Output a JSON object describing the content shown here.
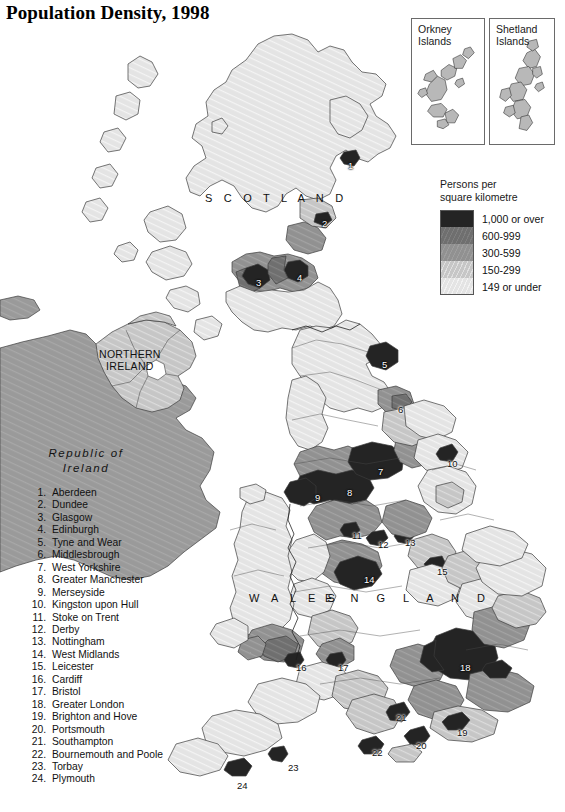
{
  "title": "Population Density, 1998",
  "insets": [
    {
      "name": "orkney",
      "label_line1": "Orkney",
      "label_line2": "Islands"
    },
    {
      "name": "shetland",
      "label_line1": "Shetland",
      "label_line2": "Islands"
    }
  ],
  "legend": {
    "title_line1": "Persons per",
    "title_line2": "square kilometre",
    "classes": [
      {
        "label": "1,000 or over",
        "color": "#242424"
      },
      {
        "label": "600-999",
        "color": "#6f6f6f"
      },
      {
        "label": "300-599",
        "color": "#919191"
      },
      {
        "label": "150-299",
        "color": "#c6c6c6"
      },
      {
        "label": "149 or under",
        "color": "#e4e4e4"
      }
    ]
  },
  "region_labels": {
    "scotland": "S C O T L A N D",
    "wales": "W A L E S",
    "england": "E N G L A N D",
    "northern_ireland_line1": "NORTHERN",
    "northern_ireland_line2": "IRELAND",
    "republic_of_ireland_line1": "Republic of",
    "republic_of_ireland_line2": "Ireland"
  },
  "city_key": [
    {
      "num": "1.",
      "name": "Aberdeen"
    },
    {
      "num": "2.",
      "name": "Dundee"
    },
    {
      "num": "3.",
      "name": "Glasgow"
    },
    {
      "num": "4.",
      "name": "Edinburgh"
    },
    {
      "num": "5.",
      "name": "Tyne and Wear"
    },
    {
      "num": "6.",
      "name": "Middlesbrough"
    },
    {
      "num": "7.",
      "name": "West Yorkshire"
    },
    {
      "num": "8.",
      "name": "Greater Manchester"
    },
    {
      "num": "9.",
      "name": "Merseyside"
    },
    {
      "num": "10.",
      "name": "Kingston upon Hull"
    },
    {
      "num": "11.",
      "name": "Stoke on Trent"
    },
    {
      "num": "12.",
      "name": "Derby"
    },
    {
      "num": "13.",
      "name": "Nottingham"
    },
    {
      "num": "14.",
      "name": "West Midlands"
    },
    {
      "num": "15.",
      "name": "Leicester"
    },
    {
      "num": "16.",
      "name": "Cardiff"
    },
    {
      "num": "17.",
      "name": "Bristol"
    },
    {
      "num": "18.",
      "name": "Greater London"
    },
    {
      "num": "19.",
      "name": "Brighton and Hove"
    },
    {
      "num": "20.",
      "name": "Portsmouth"
    },
    {
      "num": "21.",
      "name": "Southampton"
    },
    {
      "num": "22.",
      "name": "Bournemouth and Poole"
    },
    {
      "num": "23.",
      "name": "Torbay"
    },
    {
      "num": "24.",
      "name": "Plymouth"
    }
  ],
  "map_markers": [
    {
      "id": "1",
      "label": "1",
      "x": 348,
      "y": 160,
      "style": "light"
    },
    {
      "id": "2",
      "label": "2",
      "x": 322,
      "y": 218,
      "style": "light"
    },
    {
      "id": "3",
      "label": "3",
      "x": 256,
      "y": 277,
      "style": "light"
    },
    {
      "id": "4",
      "label": "4",
      "x": 297,
      "y": 272,
      "style": "light"
    },
    {
      "id": "5",
      "label": "5",
      "x": 382,
      "y": 359,
      "style": "light"
    },
    {
      "id": "6",
      "label": "6",
      "x": 398,
      "y": 404,
      "style": "dark"
    },
    {
      "id": "7",
      "label": "7",
      "x": 378,
      "y": 466,
      "style": "light"
    },
    {
      "id": "8",
      "label": "8",
      "x": 347,
      "y": 487,
      "style": "light"
    },
    {
      "id": "9",
      "label": "9",
      "x": 315,
      "y": 492,
      "style": "light"
    },
    {
      "id": "10",
      "label": "10",
      "x": 447,
      "y": 458,
      "style": "dark"
    },
    {
      "id": "11",
      "label": "11",
      "x": 352,
      "y": 530,
      "style": "dark"
    },
    {
      "id": "12",
      "label": "12",
      "x": 378,
      "y": 539,
      "style": "dark"
    },
    {
      "id": "13",
      "label": "13",
      "x": 405,
      "y": 537,
      "style": "dark"
    },
    {
      "id": "14",
      "label": "14",
      "x": 364,
      "y": 574,
      "style": "light"
    },
    {
      "id": "15",
      "label": "15",
      "x": 437,
      "y": 566,
      "style": "dark"
    },
    {
      "id": "16",
      "label": "16",
      "x": 296,
      "y": 662,
      "style": "dark"
    },
    {
      "id": "17",
      "label": "17",
      "x": 338,
      "y": 662,
      "style": "dark"
    },
    {
      "id": "18",
      "label": "18",
      "x": 460,
      "y": 662,
      "style": "light"
    },
    {
      "id": "19",
      "label": "19",
      "x": 457,
      "y": 727,
      "style": "dark"
    },
    {
      "id": "20",
      "label": "20",
      "x": 416,
      "y": 740,
      "style": "dark"
    },
    {
      "id": "21",
      "label": "21",
      "x": 396,
      "y": 712,
      "style": "dark"
    },
    {
      "id": "22",
      "label": "22",
      "x": 372,
      "y": 747,
      "style": "dark"
    },
    {
      "id": "23",
      "label": "23",
      "x": 288,
      "y": 762,
      "style": "dark"
    },
    {
      "id": "24",
      "label": "24",
      "x": 237,
      "y": 780,
      "style": "dark"
    }
  ]
}
